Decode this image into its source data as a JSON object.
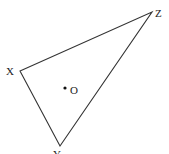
{
  "diagram": {
    "type": "geometry-triangle",
    "vertices": [
      {
        "label": "X",
        "x": 20,
        "y": 71
      },
      {
        "label": "Y",
        "x": 60,
        "y": 146
      },
      {
        "label": "Z",
        "x": 152,
        "y": 12
      }
    ],
    "point": {
      "label": "O",
      "x": 65,
      "y": 88
    },
    "stroke_color": "#333333"
  }
}
